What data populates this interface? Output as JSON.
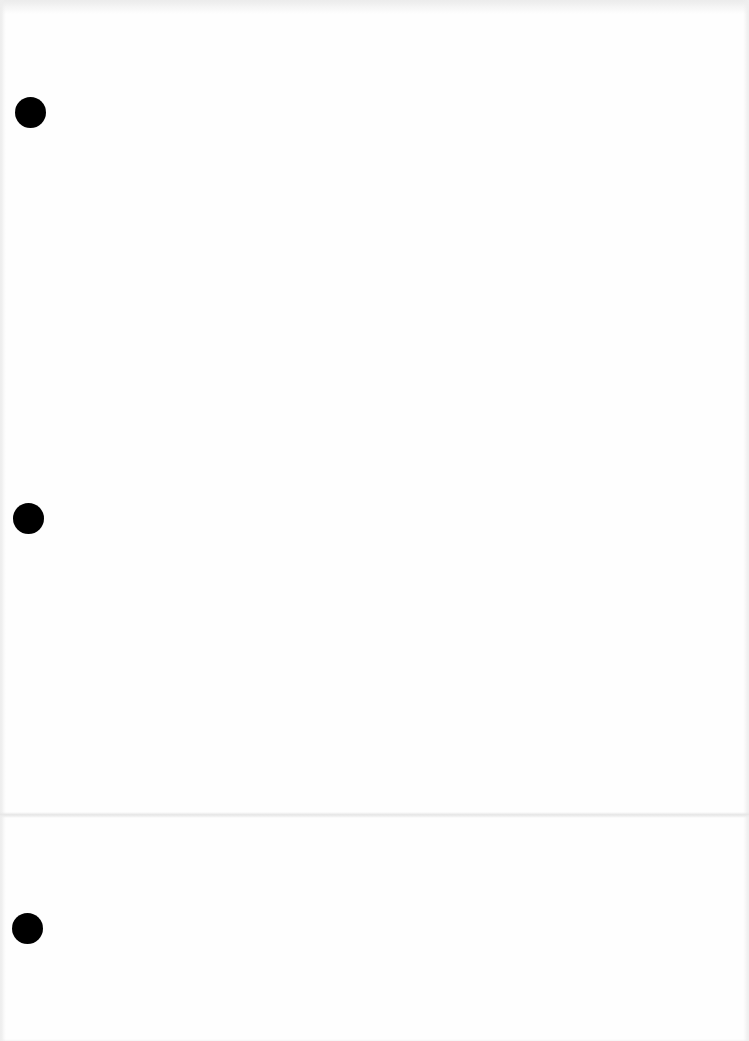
{
  "document": {
    "type": "blank-paper-sheet",
    "background_color": "#fefefe",
    "hole_color": "#000000",
    "punch_holes": [
      {
        "position": "top",
        "center_x": 30,
        "center_y": 112,
        "diameter": 31
      },
      {
        "position": "middle",
        "center_x": 28,
        "center_y": 518,
        "diameter": 31
      },
      {
        "position": "bottom",
        "center_x": 27,
        "center_y": 928,
        "diameter": 31
      }
    ],
    "fold_line_y": 815,
    "text_content": ""
  }
}
